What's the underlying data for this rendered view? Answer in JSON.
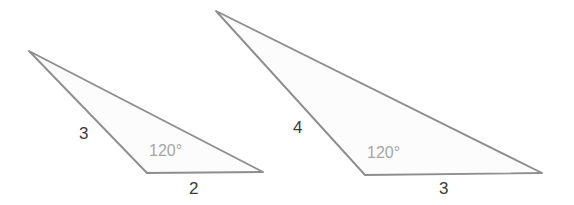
{
  "figure": {
    "canvas": {
      "width": 574,
      "height": 205
    },
    "stroke_color": "#8e8e8e",
    "fill_color": "#fcfcfc",
    "label_color": "#3a3a3a",
    "angle_label_color": "#a6a6a6",
    "background_color": "#ffffff"
  },
  "triangles": [
    {
      "name": "left-triangle",
      "vertices": [
        {
          "name": "apex",
          "x": 29,
          "y": 51
        },
        {
          "name": "bottom-left",
          "x": 147,
          "y": 173
        },
        {
          "name": "bottom-right",
          "x": 263,
          "y": 172
        }
      ],
      "points_attr": "29,51 147,173 263,172",
      "labels": {
        "left_side": "3",
        "base": "2",
        "angle": "120°"
      },
      "label_positions": {
        "left_side": {
          "x": 79,
          "y": 125
        },
        "base": {
          "x": 189,
          "y": 180
        },
        "angle": {
          "x": 149,
          "y": 143
        }
      }
    },
    {
      "name": "right-triangle",
      "vertices": [
        {
          "name": "apex",
          "x": 216,
          "y": 11
        },
        {
          "name": "bottom-left",
          "x": 365,
          "y": 175
        },
        {
          "name": "bottom-right",
          "x": 542,
          "y": 173
        }
      ],
      "points_attr": "216,11 365,175 542,173",
      "labels": {
        "left_side": "4",
        "base": "3",
        "angle": "120°"
      },
      "label_positions": {
        "left_side": {
          "x": 293,
          "y": 119
        },
        "base": {
          "x": 439,
          "y": 180
        },
        "angle": {
          "x": 367,
          "y": 145
        }
      }
    }
  ]
}
